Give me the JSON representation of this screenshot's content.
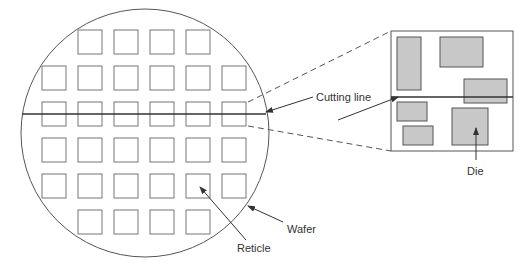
{
  "labels": {
    "cutting_line": "Cutting line",
    "die": "Die",
    "wafer": "Wafer",
    "reticle": "Reticle"
  },
  "colors": {
    "stroke": "#555555",
    "line": "#333333",
    "die_fill": "#c8c8c8",
    "background": "#ffffff"
  },
  "wafer": {
    "reticle_rows": [
      {
        "count": 4,
        "start_col": 1
      },
      {
        "count": 6,
        "start_col": 0
      },
      {
        "count": 6,
        "start_col": 0
      },
      {
        "count": 6,
        "start_col": 0
      },
      {
        "count": 6,
        "start_col": 0
      },
      {
        "count": 4,
        "start_col": 1
      }
    ]
  },
  "zoomed_reticle": {
    "die_count": 6
  }
}
